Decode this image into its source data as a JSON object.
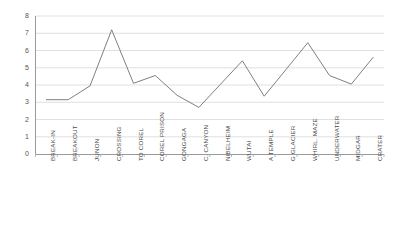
{
  "chart_data": {
    "type": "line",
    "title": "",
    "xlabel": "",
    "ylabel": "",
    "ylim": [
      0,
      8
    ],
    "ytick_step": 1,
    "grid": true,
    "legend": "none",
    "line_color": "#7f7f7f",
    "categories": [
      "BREAK-IN",
      "BREAKOUT",
      "JUNON",
      "CROSSING",
      "TO COREL",
      "COREL PRISON",
      "GONGAGA",
      "C. CANYON",
      "NIBELHEIM",
      "WUTAI",
      "A TEMPLE",
      "G GLACIER",
      "WHIRL. MAZE",
      "UNDERWATER",
      "MIDGAR",
      "CRATER"
    ],
    "values": [
      3.15,
      3.15,
      3.95,
      7.2,
      4.1,
      4.55,
      3.4,
      2.7,
      4.05,
      5.4,
      3.35,
      4.9,
      6.45,
      4.55,
      4.05,
      5.6
    ],
    "yticks": [
      "0",
      "1",
      "2",
      "3",
      "4",
      "5",
      "6",
      "7",
      "8"
    ]
  }
}
